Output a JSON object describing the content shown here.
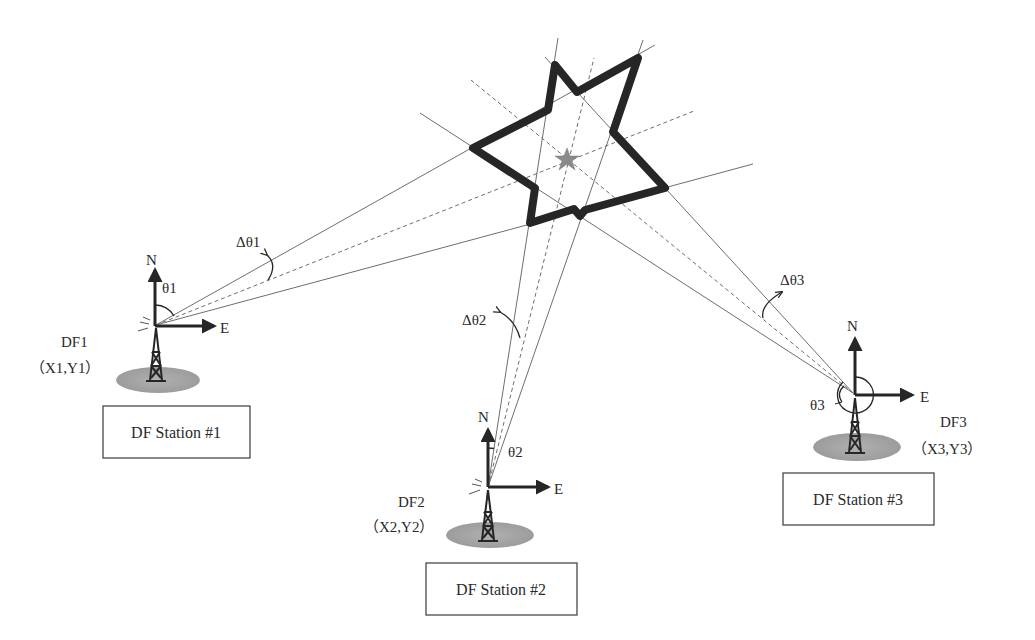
{
  "diagram": {
    "target": {
      "shape": "star-shaped emitter region",
      "center_marker": "small-star-icon",
      "colors": {
        "outline": "#262626",
        "marker": "#8a8a8a"
      }
    },
    "stations": [
      {
        "id": "DF1",
        "name_label": "DF1",
        "coord_label": "（X1,Y1）",
        "box_label": "DF Station #1",
        "angle_label": "θ1",
        "delta_label": "Δθ1",
        "north_label": "N",
        "east_label": "E"
      },
      {
        "id": "DF2",
        "name_label": "DF2",
        "coord_label": "（X2,Y2）",
        "box_label": "DF Station #2",
        "angle_label": "θ2",
        "delta_label": "Δθ2",
        "north_label": "N",
        "east_label": "E"
      },
      {
        "id": "DF3",
        "name_label": "DF3",
        "coord_label": "（X3,Y3）",
        "box_label": "DF Station #3",
        "angle_label": "θ3",
        "delta_label": "Δθ3",
        "north_label": "N",
        "east_label": "E"
      }
    ],
    "colors": {
      "ink": "#262626",
      "ray": "#6e6e6e",
      "ground": "#a8a8a8",
      "background": "#ffffff"
    }
  }
}
